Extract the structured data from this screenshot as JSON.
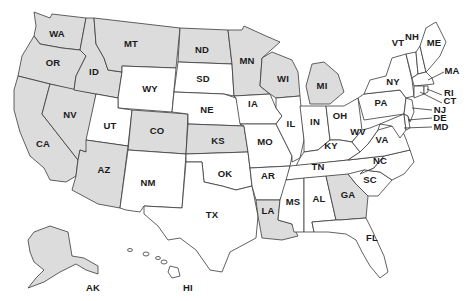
{
  "map": {
    "title": "United States",
    "colors": {
      "shaded": "#dcdcdc",
      "unshaded": "#ffffff",
      "border": "#3a3a3a",
      "label": "#1a1a1a"
    },
    "shaded_states": [
      "WA",
      "OR",
      "CA",
      "NV",
      "ID",
      "MT",
      "AZ",
      "CO",
      "ND",
      "MN",
      "WI",
      "KS",
      "MI",
      "LA",
      "GA",
      "AK"
    ],
    "states": {
      "WA": "WA",
      "OR": "OR",
      "CA": "CA",
      "NV": "NV",
      "ID": "ID",
      "MT": "MT",
      "WY": "WY",
      "UT": "UT",
      "AZ": "AZ",
      "CO": "CO",
      "NM": "NM",
      "ND": "ND",
      "SD": "SD",
      "NE": "NE",
      "KS": "KS",
      "OK": "OK",
      "TX": "TX",
      "MN": "MN",
      "IA": "IA",
      "MO": "MO",
      "AR": "AR",
      "LA": "LA",
      "WI": "WI",
      "IL": "IL",
      "MI": "MI",
      "IN": "IN",
      "OH": "OH",
      "KY": "KY",
      "TN": "TN",
      "MS": "MS",
      "AL": "AL",
      "GA": "GA",
      "FL": "FL",
      "SC": "SC",
      "NC": "NC",
      "VA": "VA",
      "WV": "WV",
      "PA": "PA",
      "NY": "NY",
      "VT": "VT",
      "NH": "NH",
      "ME": "ME",
      "MA": "MA",
      "RI": "RI",
      "CT": "CT",
      "NJ": "NJ",
      "DE": "DE",
      "MD": "MD",
      "AK": "AK",
      "HI": "HI"
    }
  }
}
